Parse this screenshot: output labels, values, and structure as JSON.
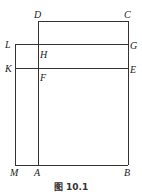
{
  "diagram": {
    "caption": "图 10.1",
    "points": {
      "D": {
        "label": "D",
        "x": 38,
        "y": 21
      },
      "C": {
        "label": "C",
        "x": 128,
        "y": 21
      },
      "L": {
        "label": "L",
        "x": 15,
        "y": 44
      },
      "H": {
        "label": "H",
        "x": 38,
        "y": 44
      },
      "G": {
        "label": "G",
        "x": 128,
        "y": 44
      },
      "K": {
        "label": "K",
        "x": 15,
        "y": 68
      },
      "F": {
        "label": "F",
        "x": 38,
        "y": 68
      },
      "E": {
        "label": "E",
        "x": 128,
        "y": 68
      },
      "M": {
        "label": "M",
        "x": 15,
        "y": 165
      },
      "A": {
        "label": "A",
        "x": 38,
        "y": 165
      },
      "B": {
        "label": "B",
        "x": 128,
        "y": 165
      }
    },
    "segments": [
      [
        "D",
        "C"
      ],
      [
        "L",
        "G"
      ],
      [
        "K",
        "E"
      ],
      [
        "M",
        "B"
      ],
      [
        "L",
        "M"
      ],
      [
        "D",
        "A"
      ],
      [
        "C",
        "B"
      ]
    ],
    "line_color": "#333333"
  }
}
